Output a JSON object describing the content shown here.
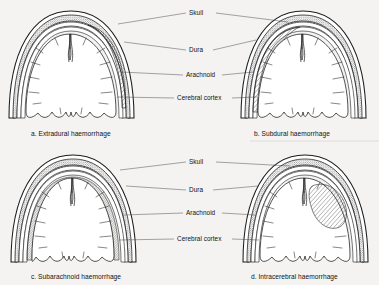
{
  "figure": {
    "background_color": "#f4f3f1",
    "ink_color": "#1b1b1b",
    "panel_count": 4
  },
  "labels": {
    "skull": "Skull",
    "dura": "Dura",
    "arachnoid": "Arachnoid",
    "cerebral_cortex": "Cerebral cortex"
  },
  "label_groups": [
    {
      "id": "top-labels",
      "items": [
        "Skull",
        "Dura",
        "Arachnoid",
        "Cerebral cortex"
      ]
    },
    {
      "id": "bottom-labels",
      "items": [
        "Skull",
        "Dura",
        "Arachnoid",
        "Cerebral cortex"
      ]
    }
  ],
  "panels": [
    {
      "key": "a",
      "letter": "a.",
      "name": "Extradural haemorrhage",
      "caption": "a. Extradural haemorrhage",
      "bleed_location": "between skull and dura, right side",
      "bleed_shape": "biconvex lens",
      "side": "right"
    },
    {
      "key": "b",
      "letter": "b.",
      "name": "Subdural haemorrhage",
      "caption": "b. Subdural haemorrhage",
      "bleed_location": "between dura and arachnoid, left side",
      "bleed_shape": "crescent",
      "side": "left"
    },
    {
      "key": "c",
      "letter": "c.",
      "name": "Subarachnoid haemorrhage",
      "caption": "c. Subarachnoid haemorrhage",
      "bleed_location": "subarachnoid space following cortical surface",
      "bleed_shape": "thin conforming layer",
      "side": "both"
    },
    {
      "key": "d",
      "letter": "d.",
      "name": "Intracerebral haemorrhage",
      "caption": "d. Intracerebral haemorrhage",
      "bleed_location": "within brain parenchyma, right hemisphere",
      "bleed_shape": "irregular blob",
      "side": "right"
    }
  ]
}
